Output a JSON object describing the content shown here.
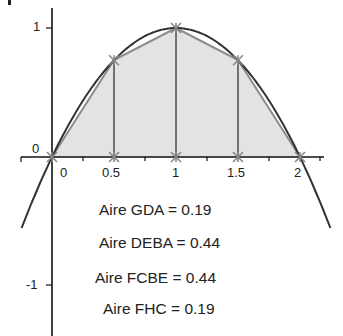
{
  "chart_data": {
    "type": "line",
    "title": "",
    "function": "f(x) = x(2 - x)",
    "xlabel": "",
    "ylabel": "",
    "x_ticks": [
      "0",
      "0.5",
      "1",
      "1.5",
      "2"
    ],
    "y_ticks": [
      "1",
      "0",
      "-1"
    ],
    "xlim": [
      -0.42,
      2.2
    ],
    "ylim": [
      -1.4,
      1.2
    ],
    "grid": false,
    "legend": null,
    "points": [
      {
        "x": 0,
        "y": 0
      },
      {
        "x": 0.5,
        "y": 0.75
      },
      {
        "x": 1,
        "y": 1
      },
      {
        "x": 1.5,
        "y": 0.75
      },
      {
        "x": 2,
        "y": 0
      }
    ],
    "trapezoids": [
      {
        "name": "GDA",
        "x0": 0,
        "x1": 0.5,
        "area": 0.19
      },
      {
        "name": "DEBA",
        "x0": 0.5,
        "x1": 1,
        "area": 0.44
      },
      {
        "name": "FCBE",
        "x0": 1,
        "x1": 1.5,
        "area": 0.44
      },
      {
        "name": "FHC",
        "x0": 1.5,
        "x1": 2,
        "area": 0.19
      }
    ],
    "colors": {
      "curve": "#333333",
      "fill": "#e3e3e3",
      "polyline": "#8c8c8c",
      "axes": "#111111"
    }
  },
  "labels": {
    "x": [
      "0",
      "0.5",
      "1",
      "1.5",
      "2"
    ],
    "y_one": "1",
    "y_zero": "0",
    "y_minus_one": "-1"
  },
  "areas": [
    "Aire GDA = 0.19",
    "Aire DEBA = 0.44",
    "Aire FCBE = 0.44",
    "Aire FHC = 0.19"
  ]
}
